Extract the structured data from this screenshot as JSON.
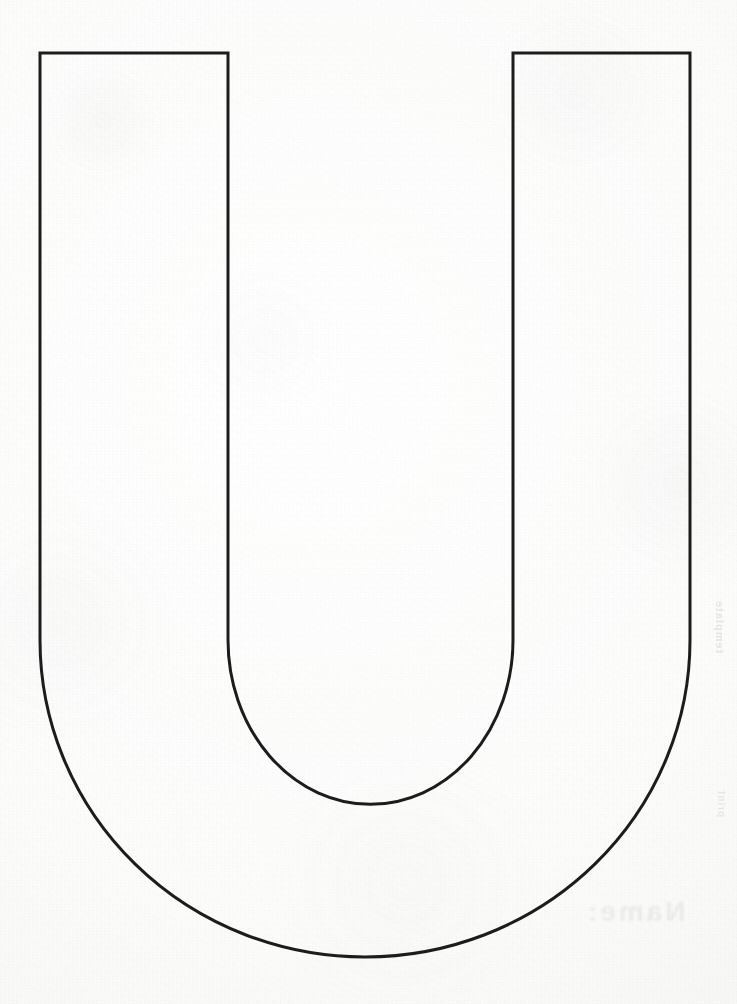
{
  "document": {
    "title": "Letter U Outline Template",
    "kind": "printable-letter-stencil",
    "letter": "U",
    "case": "uppercase",
    "caption": "Uppercase letter U outline on blank paper"
  },
  "canvas": {
    "width_px": 737,
    "height_px": 1004,
    "background_color": "#fdfdfc",
    "paper_tone": "#f6f6f4"
  },
  "artwork": {
    "name": "letter-u-outline",
    "stroke_color": "#1c1c1c",
    "stroke_width_px": 3,
    "fill": "none",
    "outline_path": "M 40 53 L 228 53 L 228 640 A 137 158 0 0 0 513 640 L 513 53 L 690 53 L 690 640 A 325 317 0 0 1 40 640 Z",
    "geometry": {
      "outer_left_x": 40,
      "outer_right_x": 690,
      "inner_left_x": 228,
      "inner_right_x": 513,
      "top_y": 53,
      "outer_bottom_y": 957,
      "inner_bottom_y": 798,
      "stem_width_px": 188,
      "counter_width_px": 285,
      "outer_arc_start_y": 640,
      "inner_arc_start_y": 640
    }
  },
  "marks": {
    "ghost_bottom_right": "Name:",
    "ghost_edge_right": "template",
    "ghost_edge_right_low": "print"
  }
}
